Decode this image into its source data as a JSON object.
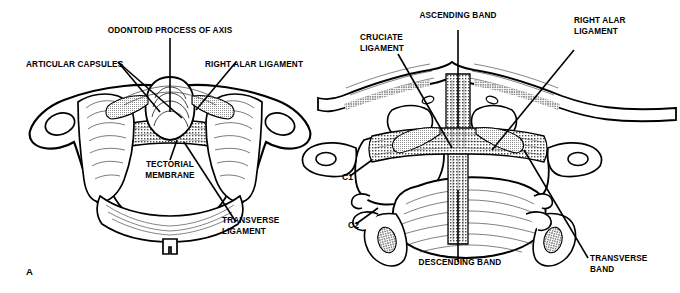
{
  "figure": {
    "background_color": "#ffffff",
    "ink_color": "#000000",
    "panel_letter": "A"
  },
  "panels": [
    {
      "id": "panel-a",
      "letter": "A",
      "view": "superior-axial-view-of-atlas",
      "labels": [
        {
          "name": "odontoid-process-of-axis",
          "text": "ODONTOID PROCESS OF AXIS"
        },
        {
          "name": "articular-capsules",
          "text": "ARTICULAR CAPSULES"
        },
        {
          "name": "right-alar-ligament",
          "text": "RIGHT ALAR LIGAMENT"
        },
        {
          "name": "tectorial-membrane",
          "text": "TECTORIAL\nMEMBRANE"
        },
        {
          "name": "transverse-ligament",
          "text": "TRANSVERSE\nLIGAMENT"
        }
      ]
    },
    {
      "id": "panel-b",
      "view": "posterior-coronal-view-cruciate-ligament",
      "labels": [
        {
          "name": "ascending-band",
          "text": "ASCENDING BAND"
        },
        {
          "name": "cruciate-ligament",
          "text": "CRUCIATE\nLIGAMENT"
        },
        {
          "name": "right-alar-ligament",
          "text": "RIGHT ALAR\nLIGAMENT"
        },
        {
          "name": "descending-band",
          "text": "DESCENDING BAND"
        },
        {
          "name": "transverse-band",
          "text": "TRANSVERSE\nBAND"
        },
        {
          "name": "vertebra-c1",
          "text": "C1"
        },
        {
          "name": "vertebra-c2",
          "text": "C2"
        }
      ]
    }
  ]
}
